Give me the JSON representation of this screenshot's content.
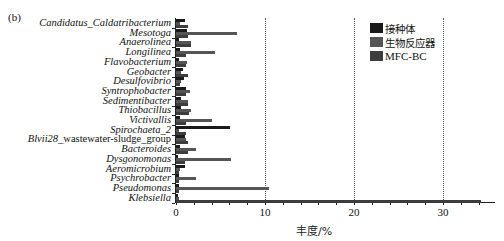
{
  "chart_data": {
    "type": "bar",
    "orientation": "horizontal",
    "panel_label": "(b)",
    "title": "",
    "xlabel": "丰度/%",
    "ylabel": "",
    "xlim": [
      0,
      35
    ],
    "x_ticks": [
      "0",
      "10",
      "20",
      "30"
    ],
    "grid": "vertical dotted lines at 10, 20, 30",
    "legend_position": "upper right",
    "categories": [
      "Candidatus_Caldatribacterium",
      "Mesotoga",
      "Anaerolinea",
      "Longilinea",
      "Flavobacterium",
      "Geobacter",
      "Desulfovibrio",
      "Syntrophobacter",
      "Sedimentibacter",
      "Thiobacillus",
      "Victivallis",
      "Spirochaeta_2",
      "Blvii28_wastewater-sludge_group",
      "Bacteroides",
      "Dysgonomonas",
      "Aeromicrobium",
      "Psychrobacter",
      "Pseudomonas",
      "Klebsiella"
    ],
    "series": [
      {
        "name": "接种体",
        "color": "#1a1a1a",
        "values": [
          1.0,
          1.2,
          0.3,
          0.4,
          0.3,
          0.8,
          0.9,
          1.1,
          0.6,
          0.6,
          0.4,
          6.1,
          1.0,
          0.4,
          0.2,
          1.0,
          0.3,
          0.3,
          0.2
        ]
      },
      {
        "name": "生物反应器",
        "color": "#555555",
        "values": [
          0.5,
          6.8,
          1.7,
          4.4,
          1.2,
          0.6,
          0.6,
          1.6,
          1.4,
          1.7,
          4.1,
          0.3,
          1.1,
          2.2,
          6.2,
          0.5,
          2.2,
          10.5,
          0.3
        ]
      },
      {
        "name": "MFC-BC",
        "color": "#3d3d3d",
        "values": [
          1.4,
          1.4,
          1.7,
          1.1,
          1.1,
          1.4,
          0.4,
          1.1,
          1.4,
          1.5,
          1.1,
          1.1,
          1.4,
          1.3,
          1.0,
          0.3,
          0.3,
          0.3,
          34.3
        ]
      }
    ]
  }
}
